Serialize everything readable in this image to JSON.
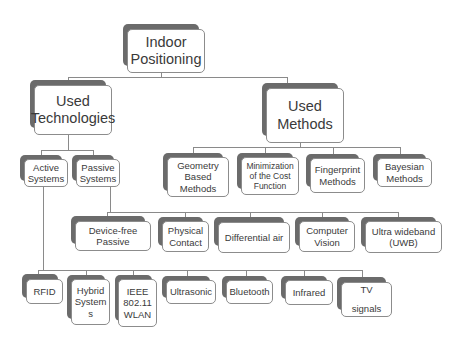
{
  "diagram": {
    "root": {
      "label": "Indoor\nPositioning"
    },
    "level1": {
      "technologies": {
        "label": "Used\nTechnologies"
      },
      "methods": {
        "label": "Used\nMethods"
      }
    },
    "technology_types": [
      {
        "label": "Active\nSystems"
      },
      {
        "label": "Passive\nSystems"
      }
    ],
    "methods": [
      {
        "label": "Geometry\nBased\nMethods"
      },
      {
        "label": "Minimization\nof the Cost\nFunction"
      },
      {
        "label": "Fingerprint\nMethods"
      },
      {
        "label": "Bayesian\nMethods"
      }
    ],
    "passive_systems": [
      {
        "label": "Device-free\nPassive"
      },
      {
        "label": "Physical\nContact"
      },
      {
        "label": "Differential air"
      },
      {
        "label": "Computer\nVision"
      },
      {
        "label": "Ultra wideband\n(UWB)"
      }
    ],
    "active_systems": [
      {
        "label": "RFID"
      },
      {
        "label": "Hybrid\nSystem\ns"
      },
      {
        "label": "IEEE\n802.11\nWLAN"
      },
      {
        "label": "Ultrasonic"
      },
      {
        "label": "Bluetooth"
      },
      {
        "label": "Infrared"
      },
      {
        "label": "TV\n\nsignals"
      }
    ]
  },
  "colors": {
    "shadow": "#6b6b6b",
    "border": "#8c8c8c",
    "connector": "#8a8a8a",
    "text": "#3a3a3a"
  }
}
